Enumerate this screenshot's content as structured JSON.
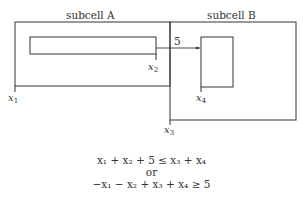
{
  "diagram": {
    "subcell_a": {
      "label": "subcell A"
    },
    "subcell_b": {
      "label": "subcell B"
    },
    "arrow": {
      "label": "5"
    },
    "variables": {
      "x1": {
        "base": "x",
        "sub": "1"
      },
      "x2": {
        "base": "x",
        "sub": "2"
      },
      "x3": {
        "base": "x",
        "sub": "3"
      },
      "x4": {
        "base": "x",
        "sub": "4"
      }
    },
    "line_color": "#333333"
  },
  "equations": {
    "line1": "x₁ + x₂ + 5 ≤ x₃ + x₄",
    "connector": "or",
    "line2": "−x₁ − x₂ + x₃ + x₄ ≥ 5"
  }
}
